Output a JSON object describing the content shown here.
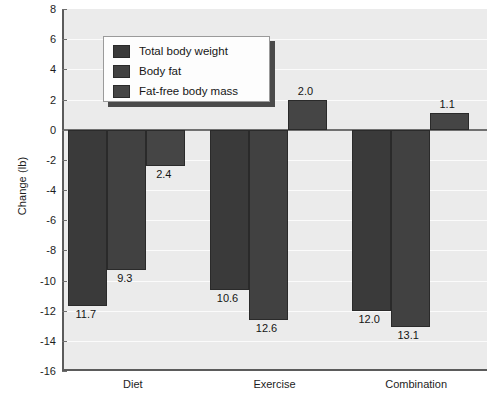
{
  "chart_data": {
    "type": "bar",
    "title": "",
    "subtitle": "",
    "xlabel": "",
    "ylabel": "Change (lb)",
    "categories": [
      "Diet",
      "Exercise",
      "Combination"
    ],
    "series": [
      {
        "name": "Total body weight",
        "values": [
          -11.7,
          -10.6,
          -12.0
        ],
        "labels": [
          "11.7",
          "10.6",
          "12.0"
        ],
        "color": "#3a3a3a"
      },
      {
        "name": "Body fat",
        "values": [
          -9.3,
          -12.6,
          -13.1
        ],
        "labels": [
          "9.3",
          "12.6",
          "13.1"
        ],
        "color": "#414141"
      },
      {
        "name": "Fat-free body mass",
        "values": [
          -2.4,
          2.0,
          1.1
        ],
        "labels": [
          "2.4",
          "2.0",
          "1.1"
        ],
        "color": "#454545"
      }
    ],
    "ylim": [
      -16,
      8
    ],
    "ytick_step": 2,
    "yticks": [
      "8",
      "6",
      "4",
      "2",
      "0",
      "-2",
      "-4",
      "-6",
      "-8",
      "-10",
      "-12",
      "-14",
      "-16"
    ],
    "ytick_values": [
      8,
      6,
      4,
      2,
      0,
      -2,
      -4,
      -6,
      -8,
      -10,
      -12,
      -14,
      -16
    ],
    "grid": true,
    "grid_axis": "y",
    "legend_position": "top-left-inside",
    "legend_entries": [
      "Total body weight",
      "Body fat",
      "Fat-free body mass"
    ],
    "plot_background": "#ebebeb",
    "gridline_color": "#fbfbfb",
    "axis_color": "#5b5b5b",
    "zero_line_color": "#707070",
    "data_labels_shown": true
  }
}
